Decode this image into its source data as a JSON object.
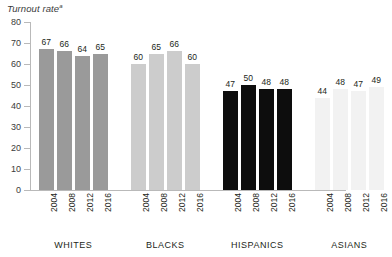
{
  "chart_data": {
    "type": "bar",
    "title": "Turnout rate",
    "title_superscript": "a",
    "xlabel": "",
    "ylabel": "",
    "ylim": [
      0,
      80
    ],
    "y_ticks": [
      0,
      10,
      20,
      30,
      40,
      50,
      60,
      70,
      80
    ],
    "grid": false,
    "legend": "none",
    "categories": [
      "2004",
      "2008",
      "2012",
      "2016"
    ],
    "groups": [
      {
        "name": "WHITES",
        "color": "#9a9a9a",
        "values": [
          67,
          66,
          64,
          65
        ]
      },
      {
        "name": "BLACKS",
        "color": "#cccccc",
        "values": [
          60,
          65,
          66,
          60
        ]
      },
      {
        "name": "HISPANICS",
        "color": "#0d0d0d",
        "values": [
          47,
          50,
          48,
          48
        ]
      },
      {
        "name": "ASIANS",
        "color": "#f2f2f2",
        "values": [
          44,
          48,
          47,
          49
        ]
      }
    ],
    "series": [
      {
        "name": "2004",
        "values": [
          67,
          60,
          47,
          44
        ]
      },
      {
        "name": "2008",
        "values": [
          66,
          65,
          50,
          48
        ]
      },
      {
        "name": "2012",
        "values": [
          64,
          66,
          48,
          47
        ]
      },
      {
        "name": "2016",
        "values": [
          65,
          60,
          48,
          49
        ]
      }
    ],
    "axis_color": "#b9b9b9",
    "text_color": "#231f20"
  }
}
